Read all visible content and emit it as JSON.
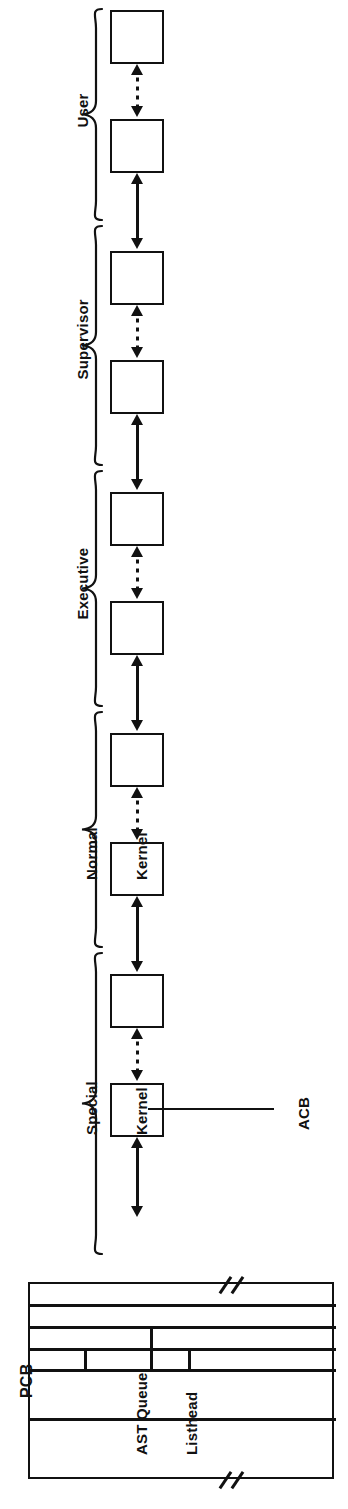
{
  "figure": {
    "kind": "ast-queue-structure-diagram",
    "orientation": "rotated-90-ccw",
    "ink_color": "#111111",
    "paper_color": "#ffffff"
  },
  "access_mode_groups": [
    {
      "id": "user",
      "label": "User",
      "lines": [
        "User"
      ],
      "acb_count": 2
    },
    {
      "id": "supervisor",
      "label": "Supervisor",
      "lines": [
        "Supervisor"
      ],
      "acb_count": 2
    },
    {
      "id": "executive",
      "label": "Executive",
      "lines": [
        "Executive"
      ],
      "acb_count": 2
    },
    {
      "id": "normal-kernel",
      "label": "Normal Kernel",
      "lines": [
        "Normal",
        "Kernel"
      ],
      "acb_count": 2
    },
    {
      "id": "special-kernel",
      "label": "Special Kernel",
      "lines": [
        "Special",
        "Kernel"
      ],
      "acb_count": 2
    }
  ],
  "acb_chain": {
    "node_label": "",
    "node_count": 10,
    "callout": {
      "text": "ACB",
      "points_to": "last-acb-node"
    },
    "links": [
      {
        "from": 0,
        "to": 1,
        "style": "dotted",
        "heads": "both"
      },
      {
        "from": 1,
        "to": 2,
        "style": "solid",
        "heads": "both"
      },
      {
        "from": 2,
        "to": 3,
        "style": "dotted",
        "heads": "both"
      },
      {
        "from": 3,
        "to": 4,
        "style": "solid",
        "heads": "both"
      },
      {
        "from": 4,
        "to": 5,
        "style": "dotted",
        "heads": "both"
      },
      {
        "from": 5,
        "to": 6,
        "style": "solid",
        "heads": "both"
      },
      {
        "from": 6,
        "to": 7,
        "style": "dotted",
        "heads": "both"
      },
      {
        "from": 7,
        "to": 8,
        "style": "solid",
        "heads": "both"
      },
      {
        "from": 8,
        "to": 9,
        "style": "dotted",
        "heads": "both"
      },
      {
        "from": 9,
        "to": "pcb",
        "style": "solid",
        "heads": "both"
      }
    ]
  },
  "pcb": {
    "title": "PCB",
    "field_label_lines": [
      "AST Queue",
      "Listhead"
    ],
    "field_label": "AST Queue Listhead",
    "cell_count": 5,
    "has_break_marks": true,
    "break_mark_count": 2
  }
}
